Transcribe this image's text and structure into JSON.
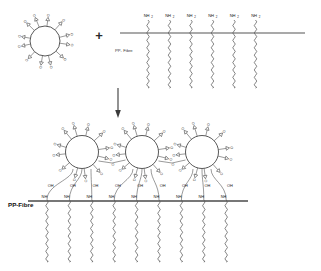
{
  "diagram": {
    "type": "chemical-reaction-scheme",
    "background_color": "#ffffff",
    "line_color": "#555555",
    "text_color": "#1a1a1a"
  },
  "reactants": {
    "nanoparticle": {
      "label": "",
      "arm_count": 12,
      "end_group": "epoxide",
      "end_group_symbol": "O",
      "core_shape": "circle"
    },
    "plus_sign": "+",
    "fibre_top": {
      "label": "PP- Fibre",
      "chain_count": 6,
      "terminal_group": "NH",
      "terminal_subscript": "2"
    }
  },
  "arrow": {
    "direction": "down",
    "label": ""
  },
  "product": {
    "fibre_bottom": {
      "label": "PP-Fibre",
      "chain_count": 9,
      "link_groups": [
        "NH",
        "NH",
        "NH",
        "NH",
        "NH",
        "NH",
        "NH",
        "NH",
        "NH"
      ],
      "hydroxyl_groups": [
        "OH",
        "OH",
        "OH",
        "OH",
        "OH",
        "OH",
        "OH",
        "OH",
        "OH"
      ]
    },
    "nanoparticles": {
      "count": 3,
      "arm_count": 12,
      "end_group_symbol": "O",
      "bridge_group_symbol": "O"
    }
  },
  "labels": {
    "amine": "NH",
    "amine_subscript": "2",
    "hydroxyl": "OH",
    "amide_link": "NH",
    "oxygen": "O",
    "fibre_top": "PP- Fibre",
    "fibre_bottom": "PP-Fibre",
    "plus": "+"
  }
}
